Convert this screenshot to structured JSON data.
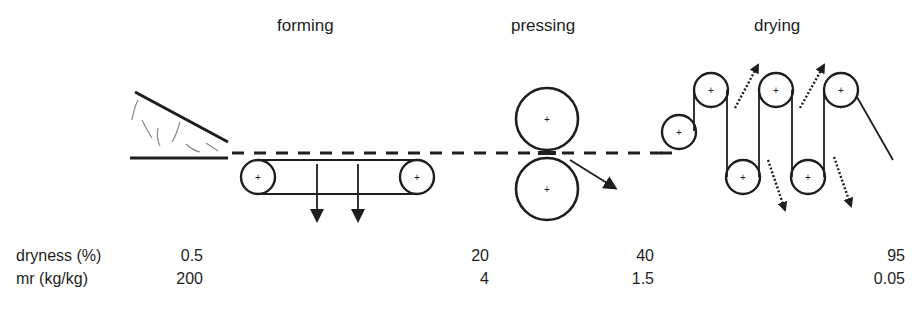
{
  "stages": {
    "forming": "forming",
    "pressing": "pressing",
    "drying": "drying"
  },
  "table": {
    "rows": [
      {
        "label": "dryness (%)",
        "values": [
          "0.5",
          "20",
          "40",
          "95"
        ]
      },
      {
        "label": "mr (kg/kg)",
        "values": [
          "200",
          "4",
          "1.5",
          "0.05"
        ]
      }
    ]
  },
  "colors": {
    "line": "#1e1e1e",
    "fibre": "#888888"
  }
}
